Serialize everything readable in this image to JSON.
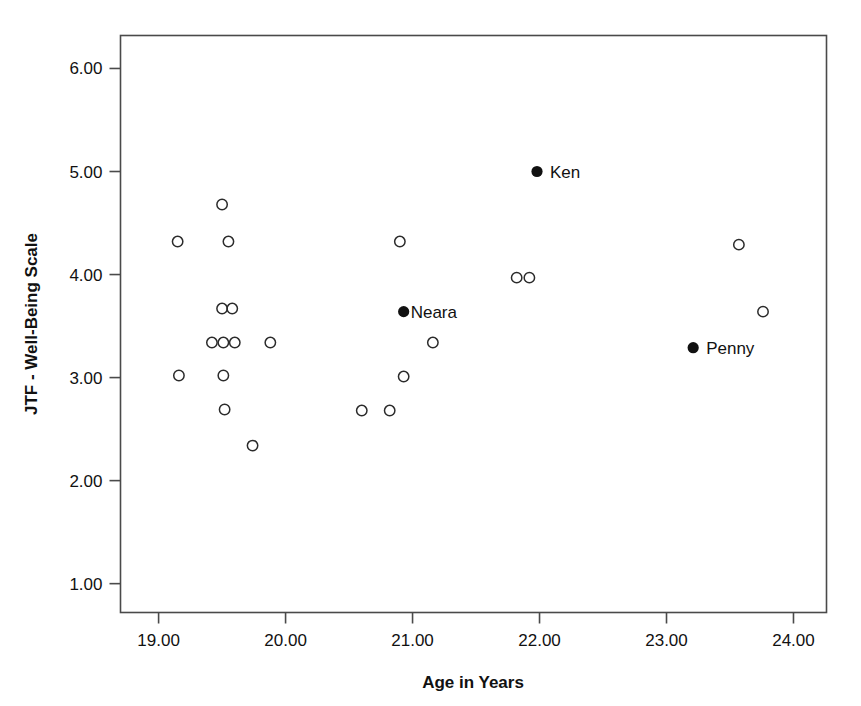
{
  "chart_data": {
    "type": "scatter",
    "title": "",
    "xlabel": "Age in Years",
    "ylabel": "JTF - Well-Being Scale",
    "xlim": [
      18.7,
      24.26
    ],
    "ylim": [
      0.72,
      6.32
    ],
    "xticks": [
      19.0,
      20.0,
      21.0,
      22.0,
      23.0,
      24.0
    ],
    "xticklabels": [
      "19.00",
      "20.00",
      "21.00",
      "22.00",
      "23.00",
      "24.00"
    ],
    "yticks": [
      1.0,
      2.0,
      3.0,
      4.0,
      5.0,
      6.0
    ],
    "yticklabels": [
      "1.00",
      "2.00",
      "3.00",
      "4.00",
      "5.00",
      "6.00"
    ],
    "grid": false,
    "legend": null,
    "series": [
      {
        "name": "unlabeled-cases",
        "marker": "open-circle",
        "color": "#2b2b2b",
        "points": [
          {
            "x": 19.15,
            "y": 4.32
          },
          {
            "x": 19.5,
            "y": 4.68
          },
          {
            "x": 19.55,
            "y": 4.32
          },
          {
            "x": 19.5,
            "y": 3.67
          },
          {
            "x": 19.58,
            "y": 3.67
          },
          {
            "x": 19.42,
            "y": 3.34
          },
          {
            "x": 19.51,
            "y": 3.34
          },
          {
            "x": 19.6,
            "y": 3.34
          },
          {
            "x": 19.88,
            "y": 3.34
          },
          {
            "x": 19.16,
            "y": 3.02
          },
          {
            "x": 19.51,
            "y": 3.02
          },
          {
            "x": 19.52,
            "y": 2.69
          },
          {
            "x": 19.74,
            "y": 2.34
          },
          {
            "x": 20.6,
            "y": 2.68
          },
          {
            "x": 20.82,
            "y": 2.68
          },
          {
            "x": 20.9,
            "y": 4.32
          },
          {
            "x": 20.93,
            "y": 3.01
          },
          {
            "x": 21.16,
            "y": 3.34
          },
          {
            "x": 21.82,
            "y": 3.97
          },
          {
            "x": 21.92,
            "y": 3.97
          },
          {
            "x": 23.57,
            "y": 4.29
          },
          {
            "x": 23.76,
            "y": 3.64
          }
        ]
      },
      {
        "name": "highlighted-cases",
        "marker": "filled-circle",
        "color": "#111111",
        "points": [
          {
            "x": 21.98,
            "y": 5.0,
            "label": "Ken",
            "label_side": "right"
          },
          {
            "x": 20.93,
            "y": 3.64,
            "label": "Neara",
            "label_side": "right-tight"
          },
          {
            "x": 23.21,
            "y": 3.29,
            "label": "Penny",
            "label_side": "right"
          }
        ]
      }
    ]
  }
}
